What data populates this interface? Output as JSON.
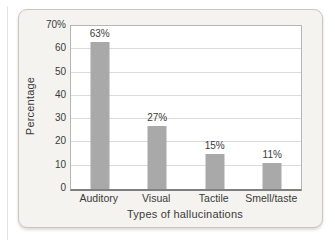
{
  "chart_data": {
    "type": "bar",
    "title": "",
    "categories": [
      "Auditory",
      "Visual",
      "Tactile",
      "Smell/taste"
    ],
    "values": [
      63,
      27,
      15,
      11
    ],
    "value_labels": [
      "63%",
      "27%",
      "15%",
      "11%"
    ],
    "xlabel": "Types of hallucinations",
    "ylabel": "Percentage",
    "ylim": [
      0,
      70
    ],
    "ytick_step": 10,
    "ytick_labels": [
      "0",
      "10",
      "20",
      "30",
      "40",
      "50",
      "60",
      "70%"
    ],
    "grid": "horizontal",
    "legend": "none"
  },
  "colors": {
    "bar": "#a9a9a9",
    "gridline": "#dcdcdc",
    "axis_line": "#7f7f7f",
    "plot_border": "#b6b6b6",
    "plot_background": "#ffffff",
    "card_background": "#f4f3ef",
    "card_border": "#c9c6c1",
    "text": "#3b3b3b"
  }
}
